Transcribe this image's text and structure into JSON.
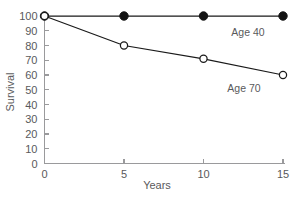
{
  "chart_data": {
    "type": "line",
    "title": "",
    "xlabel": "Years",
    "ylabel": "Survival",
    "x": [
      0,
      5,
      10,
      15
    ],
    "xlim": [
      0,
      15
    ],
    "ylim": [
      0,
      100
    ],
    "xticks": [
      "0",
      "5",
      "10",
      "15"
    ],
    "yticks": [
      "0",
      "10",
      "20",
      "30",
      "40",
      "50",
      "60",
      "70",
      "80",
      "90",
      "100"
    ],
    "grid": false,
    "legend_position": "inline-annotations",
    "series": [
      {
        "name": "Age 40",
        "values": [
          100,
          100,
          100,
          100
        ],
        "marker": "filled-circle",
        "color": "#131313",
        "label_x": 15,
        "label_y": 100
      },
      {
        "name": "Age 70",
        "values": [
          100,
          80,
          71,
          60
        ],
        "marker": "open-circle",
        "color": "#1a1a1a",
        "label_x": 15,
        "label_y": 60
      }
    ],
    "annotations": [
      {
        "text": "Age 40",
        "series": "Age 40"
      },
      {
        "text": "Age 70",
        "series": "Age 70"
      }
    ]
  },
  "axes": {
    "y": {
      "title": "Survival",
      "ticks": [
        {
          "label": "100",
          "value": 100
        },
        {
          "label": "90",
          "value": 90
        },
        {
          "label": "80",
          "value": 80
        },
        {
          "label": "70",
          "value": 70
        },
        {
          "label": "60",
          "value": 60
        },
        {
          "label": "50",
          "value": 50
        },
        {
          "label": "40",
          "value": 40
        },
        {
          "label": "30",
          "value": 30
        },
        {
          "label": "20",
          "value": 20
        },
        {
          "label": "10",
          "value": 10
        },
        {
          "label": "0",
          "value": 0
        }
      ]
    },
    "x": {
      "title": "Years",
      "ticks": [
        {
          "label": "0",
          "value": 0
        },
        {
          "label": "5",
          "value": 5
        },
        {
          "label": "10",
          "value": 10
        },
        {
          "label": "15",
          "value": 15
        }
      ]
    }
  },
  "labels": {
    "y_tick_100": "100",
    "y_tick_90": "90",
    "y_tick_80": "80",
    "y_tick_70": "70",
    "y_tick_60": "60",
    "y_tick_50": "50",
    "y_tick_40": "40",
    "y_tick_30": "30",
    "y_tick_20": "20",
    "y_tick_10": "10",
    "y_tick_0": "0",
    "x_tick_0": "0",
    "x_tick_5": "5",
    "x_tick_10": "10",
    "x_tick_15": "15",
    "x_title": "Years",
    "y_title": "Survival",
    "series_age40": "Age 40",
    "series_age70": "Age 70"
  },
  "colors": {
    "axis": "#9a9a9c",
    "text": "#59595b",
    "data_line": "#1a1a1a",
    "marker_filled": "#131313",
    "marker_open_fill": "#ffffff",
    "background": "#ffffff"
  }
}
